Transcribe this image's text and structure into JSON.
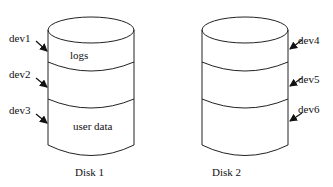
{
  "diagram": {
    "type": "disk-partition-diagram",
    "disks": [
      {
        "label": "Disk 1",
        "partitions": [
          {
            "device": "dev1",
            "content": "logs"
          },
          {
            "device": "dev2",
            "content": ""
          },
          {
            "device": "dev3",
            "content": "user data"
          }
        ],
        "arrow_side": "left"
      },
      {
        "label": "Disk 2",
        "partitions": [
          {
            "device": "dev4",
            "content": ""
          },
          {
            "device": "dev5",
            "content": ""
          },
          {
            "device": "dev6",
            "content": ""
          }
        ],
        "arrow_side": "right"
      }
    ]
  }
}
